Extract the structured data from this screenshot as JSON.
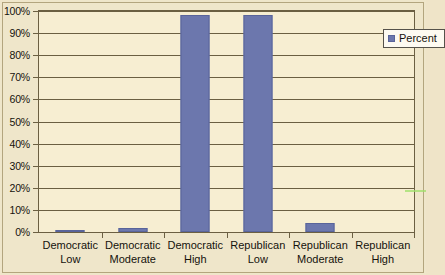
{
  "chart_data": {
    "type": "bar",
    "title": "",
    "xlabel": "",
    "ylabel": "",
    "ylim": [
      0,
      100
    ],
    "ytick_labels": [
      "100%",
      "90%",
      "80%",
      "70%",
      "60%",
      "50%",
      "40%",
      "30%",
      "20%",
      "10%",
      "0%"
    ],
    "ytick_values": [
      100,
      90,
      80,
      70,
      60,
      50,
      40,
      30,
      20,
      10,
      0
    ],
    "grid": true,
    "legend_position": "top-right",
    "categories": [
      "Democratic Low",
      "Democratic Moderate",
      "Democratic High",
      "Republican Low",
      "Republican Moderate",
      "Republican High"
    ],
    "category_lines": [
      [
        "Democratic",
        "Low"
      ],
      [
        "Democratic",
        "Moderate"
      ],
      [
        "Democratic",
        "High"
      ],
      [
        "Republican",
        "Low"
      ],
      [
        "Republican",
        "Moderate"
      ],
      [
        "Republican",
        "High"
      ]
    ],
    "series": [
      {
        "name": "Percent",
        "color": "#6c77ad",
        "values": [
          1,
          2,
          98,
          98,
          4,
          0
        ]
      }
    ]
  },
  "legend": {
    "entry_label": "Percent",
    "swatch_icon": "square-marker-icon"
  },
  "colors": {
    "bar": "#6c77ad",
    "bar_border": "#59649a",
    "plot_background": "#f7eed2",
    "page_background": "#efe6ca",
    "gridline": "#6b5f42",
    "text": "#15120c"
  }
}
